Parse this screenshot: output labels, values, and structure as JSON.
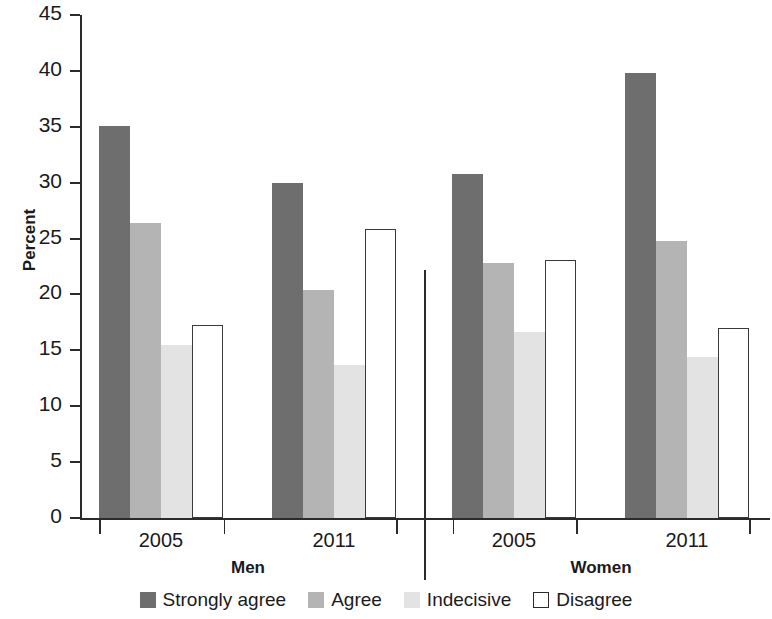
{
  "chart_data": {
    "type": "bar",
    "title": "",
    "xlabel": "",
    "ylabel": "Percent",
    "ylim": [
      0,
      45
    ],
    "yticks": [
      0,
      5,
      10,
      15,
      20,
      25,
      30,
      35,
      40,
      45
    ],
    "ytick_labels": [
      "0",
      "5",
      "10",
      "15",
      "20",
      "25",
      "30",
      "35",
      "40",
      "45"
    ],
    "grid": false,
    "legend_position": "bottom",
    "supergroups": [
      "Men",
      "Women"
    ],
    "categories": [
      "2005",
      "2011",
      "2005",
      "2011"
    ],
    "group_labels": [
      "Men 2005",
      "Men 2011",
      "Women 2005",
      "Women 2011"
    ],
    "series": [
      {
        "name": "Strongly agree",
        "color": "#6e6e6e",
        "values": [
          35.1,
          30.0,
          30.8,
          39.8
        ]
      },
      {
        "name": "Agree",
        "color": "#b4b4b4",
        "values": [
          26.4,
          20.4,
          22.8,
          24.8
        ]
      },
      {
        "name": "Indecisive",
        "color": "#e3e3e3",
        "values": [
          15.5,
          13.7,
          16.6,
          14.4
        ]
      },
      {
        "name": "Disagree",
        "color": "#ffffff",
        "values": [
          17.3,
          25.9,
          23.1,
          17.0
        ]
      }
    ]
  },
  "axis": {
    "y_title": "Percent",
    "ticks": [
      "45",
      "40",
      "35",
      "30",
      "25",
      "20",
      "15",
      "10",
      "5",
      "0"
    ]
  },
  "x_axis": {
    "tick_labels": [
      "2005",
      "2011",
      "2005",
      "2011"
    ],
    "supergroups": [
      "Men",
      "Women"
    ]
  },
  "legend": {
    "items": [
      {
        "label": "Strongly agree",
        "swatch": "strongly"
      },
      {
        "label": "Agree",
        "swatch": "agree"
      },
      {
        "label": "Indecisive",
        "swatch": "indecisive"
      },
      {
        "label": "Disagree",
        "swatch": "disagree"
      }
    ]
  }
}
